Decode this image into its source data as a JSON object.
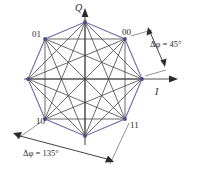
{
  "figure": {
    "type": "constellation-diagram",
    "modulation": "8-PSK phase transition diagram",
    "axes": {
      "vertical_label": "Q",
      "horizontal_label": "I",
      "origin": [
        85,
        79
      ]
    },
    "colors": {
      "octagon_stroke": "#6b6fa8",
      "chord_stroke": "#3a3a3a",
      "axis_stroke": "#8a8a8a",
      "arrow_stroke": "#2b2b2b",
      "text": "#2b2b2b",
      "vertex_fill": "#4a4f8c",
      "background": "#ffffff"
    },
    "constellation": {
      "radius": 57,
      "point_count": 8,
      "points": [
        {
          "id": "p0",
          "angle_deg": 0,
          "x": 142,
          "y": 79,
          "label": ""
        },
        {
          "id": "p1",
          "angle_deg": 45,
          "x": 125,
          "y": 39,
          "label": "00"
        },
        {
          "id": "p2",
          "angle_deg": 90,
          "x": 85,
          "y": 22,
          "label": ""
        },
        {
          "id": "p3",
          "angle_deg": 135,
          "x": 45,
          "y": 39,
          "label": "01"
        },
        {
          "id": "p4",
          "angle_deg": 180,
          "x": 28,
          "y": 79,
          "label": ""
        },
        {
          "id": "p5",
          "angle_deg": 225,
          "x": 45,
          "y": 119,
          "label": "10"
        },
        {
          "id": "p6",
          "angle_deg": 270,
          "x": 85,
          "y": 136,
          "label": ""
        },
        {
          "id": "p7",
          "angle_deg": 315,
          "x": 125,
          "y": 119,
          "label": "11"
        }
      ]
    },
    "point_labels": [
      {
        "text": "01",
        "x": 34,
        "y": 36
      },
      {
        "text": "00",
        "x": 124,
        "y": 34
      },
      {
        "text": "10",
        "x": 38,
        "y": 123
      },
      {
        "text": "11",
        "x": 131,
        "y": 127
      }
    ],
    "annotations": [
      {
        "id": "phase-45",
        "delta_symbol": "Δ",
        "phi_symbol": "φ",
        "equals": " = ",
        "value": "45°",
        "full_text": "Δφ = 45°",
        "text_x": 152,
        "text_y": 46,
        "arrow_from": [
          152,
          28
        ],
        "arrow_to": [
          166,
          64
        ]
      },
      {
        "id": "phase-135",
        "delta_symbol": "Δ",
        "phi_symbol": "φ",
        "equals": " = ",
        "value": "135°",
        "full_text": "Δφ = 135°",
        "text_x": 24,
        "text_y": 155,
        "arrow_from": [
          14,
          133
        ],
        "arrow_to": [
          112,
          162
        ]
      }
    ],
    "chords": [
      [
        1,
        4
      ],
      [
        1,
        5
      ],
      [
        1,
        6
      ],
      [
        1,
        7
      ],
      [
        2,
        4
      ],
      [
        2,
        5
      ],
      [
        2,
        6
      ],
      [
        2,
        7
      ],
      [
        2,
        0
      ],
      [
        3,
        5
      ],
      [
        3,
        6
      ],
      [
        3,
        7
      ],
      [
        3,
        0
      ],
      [
        0,
        4
      ],
      [
        0,
        5
      ],
      [
        0,
        6
      ],
      [
        4,
        6
      ],
      [
        4,
        7
      ],
      [
        5,
        7
      ],
      [
        1,
        3
      ],
      [
        2,
        0
      ]
    ]
  }
}
